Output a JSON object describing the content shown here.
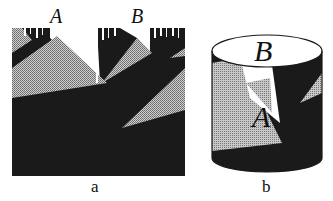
{
  "figure": {
    "panel_a": {
      "caption": "a",
      "labels": {
        "A": "A",
        "B": "B"
      }
    },
    "panel_b": {
      "caption": "b",
      "labels": {
        "A": "A",
        "B": "B"
      }
    }
  },
  "colors": {
    "dark": "#1a1a1a",
    "gray": "#a8a8a8",
    "white": "#ffffff"
  }
}
